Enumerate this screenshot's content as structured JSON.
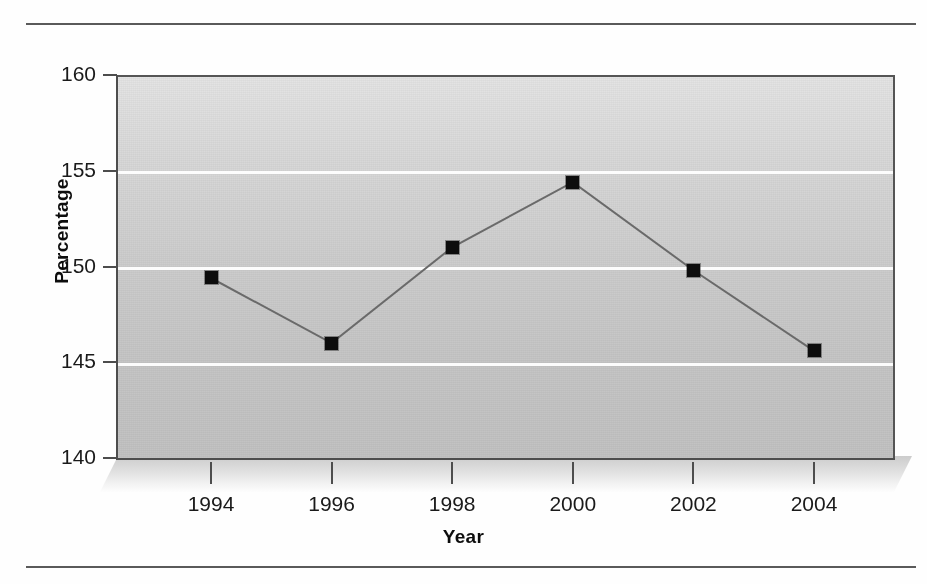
{
  "figure": {
    "rules": [
      "top-rule",
      "bottom-rule"
    ],
    "background_color": "#c8c8c8",
    "gridline_color": "#fcfcfc",
    "marker_color": "#0d0d0d",
    "line_color": "#6a6a6a"
  },
  "chart_data": {
    "type": "line",
    "title": "",
    "xlabel": "Year",
    "ylabel": "Percentage",
    "categories": [
      "1994",
      "1996",
      "1998",
      "2000",
      "2002",
      "2004"
    ],
    "x": [
      1994,
      1996,
      1998,
      2000,
      2002,
      2004
    ],
    "values": [
      149.4,
      146.0,
      151.0,
      154.4,
      149.8,
      145.6
    ],
    "series": [
      {
        "name": "Percentage",
        "values": [
          149.4,
          146.0,
          151.0,
          154.4,
          149.8,
          145.6
        ]
      }
    ],
    "ylim": [
      140,
      160
    ],
    "yticks": [
      140,
      145,
      150,
      155,
      160
    ],
    "ytick_labels": [
      "140",
      "145",
      "150",
      "155",
      "160"
    ],
    "xticks": [
      1994,
      1996,
      1998,
      2000,
      2002,
      2004
    ],
    "xtick_labels": [
      "1994",
      "1996",
      "1998",
      "2000",
      "2002",
      "2004"
    ],
    "grid": "horizontal",
    "legend": "none",
    "marker": "square",
    "style": "3d-shadow-plot-area"
  }
}
